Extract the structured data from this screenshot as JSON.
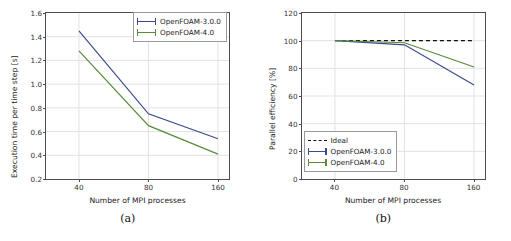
{
  "figure": {
    "panels": [
      {
        "caption": "(a)",
        "xlabel": "Number of MPI processes",
        "ylabel": "Execution time per time step [s]",
        "xticks": [
          "40",
          "80",
          "160"
        ],
        "yticks": [
          "0.2",
          "0.4",
          "0.6",
          "0.8",
          "1.0",
          "1.2",
          "1.4",
          "1.6"
        ],
        "legend": [
          {
            "label": "OpenFOAM-3.0.0",
            "style": "errorbar",
            "color": "#3b4a8c"
          },
          {
            "label": "OpenFOAM-4.0",
            "style": "errorbar",
            "color": "#5a8a3c"
          }
        ]
      },
      {
        "caption": "(b)",
        "xlabel": "Number of MPI processes",
        "ylabel": "Parallel efficiency [%]",
        "xticks": [
          "40",
          "80",
          "160"
        ],
        "yticks": [
          "0",
          "20",
          "40",
          "60",
          "80",
          "100",
          "120"
        ],
        "legend": [
          {
            "label": "Ideal",
            "style": "dashed",
            "color": "#111111"
          },
          {
            "label": "OpenFOAM-3.0.0",
            "style": "errorbar",
            "color": "#3b4a8c"
          },
          {
            "label": "OpenFOAM-4.0",
            "style": "errorbar",
            "color": "#5a8a3c"
          }
        ]
      }
    ]
  },
  "colors": {
    "openfoam_300": "#3b4a8c",
    "openfoam_40": "#5a8a3c",
    "ideal": "#111111",
    "grid": "#e2e2e2",
    "axis": "#4d4d4d"
  },
  "chart_data": [
    {
      "type": "line",
      "title": "",
      "subfigure": "(a)",
      "xlabel": "Number of MPI processes",
      "ylabel": "Execution time per time step [s]",
      "x": [
        40,
        80,
        160
      ],
      "xscale": "log2",
      "xticklabels": [
        "40",
        "80",
        "160"
      ],
      "ylim": [
        0.2,
        1.6
      ],
      "yticks": [
        0.2,
        0.4,
        0.6,
        0.8,
        1.0,
        1.2,
        1.4,
        1.6
      ],
      "grid": true,
      "legend_position": "upper right",
      "series": [
        {
          "name": "OpenFOAM-3.0.0",
          "values": [
            1.45,
            0.75,
            0.54
          ],
          "color": "#3b4a8c"
        },
        {
          "name": "OpenFOAM-4.0",
          "values": [
            1.28,
            0.65,
            0.41
          ],
          "color": "#5a8a3c"
        }
      ]
    },
    {
      "type": "line",
      "title": "",
      "subfigure": "(b)",
      "xlabel": "Number of MPI processes",
      "ylabel": "Parallel efficiency [%]",
      "x": [
        40,
        80,
        160
      ],
      "xscale": "log2",
      "xticklabels": [
        "40",
        "80",
        "160"
      ],
      "ylim": [
        0,
        120
      ],
      "yticks": [
        0,
        20,
        40,
        60,
        80,
        100,
        120
      ],
      "grid": true,
      "legend_position": "lower left",
      "series": [
        {
          "name": "Ideal",
          "values": [
            100,
            100,
            100
          ],
          "color": "#111111",
          "linestyle": "dashed"
        },
        {
          "name": "OpenFOAM-3.0.0",
          "values": [
            100,
            97,
            68
          ],
          "color": "#3b4a8c"
        },
        {
          "name": "OpenFOAM-4.0",
          "values": [
            100,
            98.5,
            81
          ],
          "color": "#5a8a3c"
        }
      ]
    }
  ]
}
